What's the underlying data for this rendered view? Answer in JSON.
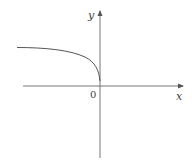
{
  "diagram": {
    "type": "function-graph",
    "axes": {
      "x_label": "x",
      "y_label": "y",
      "origin_label": "0"
    },
    "curve": {
      "description": "increasing-magnitude curve in second quadrant ending at origin, resembling y = sqrt(-x)",
      "color": "#555555"
    },
    "colors": {
      "axis": "#666666",
      "curve": "#555555",
      "background": "#ffffff"
    }
  }
}
